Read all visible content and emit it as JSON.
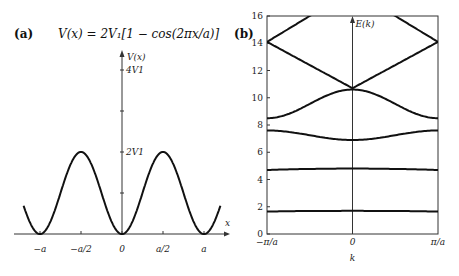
{
  "chart_data": [
    {
      "type": "line",
      "panel": "(a)",
      "title": "V(x) = 2V1 [1 − cos 2πx/a]",
      "xlabel": "x",
      "ylabel": "V(x)",
      "x_ticks": [
        "−a",
        "−a/2",
        "0",
        "a/2",
        "a"
      ],
      "y_ticks": [
        "2V1",
        "4V1"
      ],
      "series": [
        {
          "name": "V(x)",
          "function": "2*V1*(1-cos(2*pi*x/a))",
          "x_range": [
            -1.2,
            1.2
          ]
        }
      ]
    },
    {
      "type": "line",
      "panel": "(b)",
      "xlabel": "k",
      "ylabel": "E(k)",
      "x_ticks": [
        "−π/a",
        "0",
        "π/a"
      ],
      "y_ticks": [
        0,
        2,
        4,
        6,
        8,
        10,
        12,
        14,
        16
      ],
      "ylim": [
        0,
        16
      ],
      "x": [
        -1,
        -0.5,
        0,
        0.5,
        1
      ],
      "series": [
        {
          "name": "band 1",
          "values": [
            1.65,
            1.68,
            1.7,
            1.68,
            1.65
          ]
        },
        {
          "name": "band 2",
          "values": [
            4.7,
            4.75,
            4.8,
            4.75,
            4.7
          ]
        },
        {
          "name": "band 3",
          "values": [
            7.6,
            7.3,
            6.9,
            7.3,
            7.6
          ]
        },
        {
          "name": "band 4",
          "values": [
            8.5,
            9.3,
            10.6,
            9.3,
            8.5
          ]
        },
        {
          "name": "band 5",
          "values": [
            14.1,
            12.3,
            10.7,
            12.3,
            14.1
          ]
        },
        {
          "name": "band 6",
          "values": [
            14.1,
            16.0,
            16.0,
            16.0,
            14.1
          ]
        }
      ]
    }
  ],
  "labels": {
    "a_panel": "(a)",
    "b_panel": "(b)",
    "a_equation": "V(x) = 2V₁[1 − cos(2πx/a)]",
    "a_ylabel": "V(x)",
    "a_xlabel": "x",
    "b_ylabel": "E(k)",
    "b_xlabel": "k"
  }
}
